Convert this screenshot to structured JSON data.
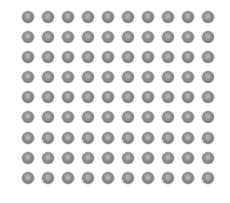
{
  "image": {
    "description": "Grid of grey coins on white background",
    "rows": 9,
    "columns": 10,
    "total_items": 90,
    "item": "coin",
    "colors": {
      "background": "#ffffff",
      "coin": "#8c8c8c"
    }
  }
}
